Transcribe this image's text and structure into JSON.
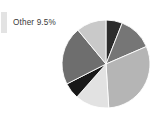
{
  "figure": {
    "background_color": "#ffffff"
  },
  "callout": {
    "label": "Other 9.5%",
    "swatch_color": "#e3e3e3",
    "text_color": "#3a3a3a"
  },
  "chart_data": {
    "type": "pie",
    "title": "",
    "subtitle": "",
    "xlabel": "",
    "ylabel": "",
    "grid": false,
    "legend_position": "left-callout",
    "start_angle_deg": 0,
    "direction": "clockwise",
    "center": [
      106,
      64
    ],
    "radius": 44,
    "annotations": [
      "Other 9.5%"
    ],
    "categories": [
      "Slice 1",
      "Slice 2",
      "Slice 3",
      "Slice 4",
      "Slice 5",
      "Slice 6",
      "Slice 7"
    ],
    "values": [
      6.0,
      12.5,
      30.5,
      12.5,
      6.0,
      21.5,
      11.0
    ],
    "labels": [
      "6.0%",
      "12.5%",
      "30.5%",
      "12.5%",
      "6.0%",
      "21.5%",
      "11.0%"
    ],
    "colors": [
      "#2c2c2c",
      "#767676",
      "#b5b5b5",
      "#e2e2e2",
      "#181818",
      "#6e6e6e",
      "#c9c9c9"
    ],
    "slice_angles_deg": [
      21.6,
      45.0,
      109.8,
      45.0,
      21.6,
      77.4,
      39.6
    ],
    "total": 100.0
  }
}
